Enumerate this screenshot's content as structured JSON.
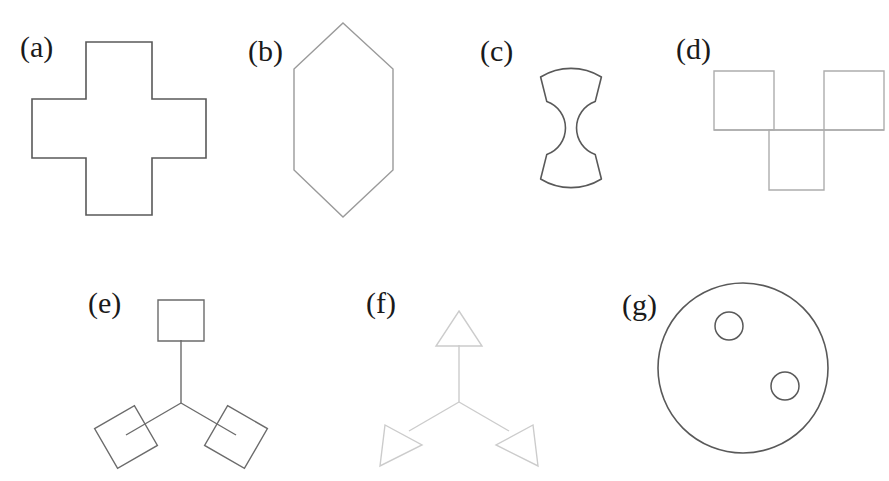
{
  "figure": {
    "background_color": "#ffffff",
    "width": 889,
    "height": 481,
    "panel_count": 7,
    "label_color": "#1a1a1a"
  },
  "panels": [
    {
      "key": "a",
      "label": "(a)",
      "shape_name": "greek-cross",
      "description": "Equal-armed plus sign / Greek cross outline",
      "stroke_color": "#595959",
      "stroke_width": 1.6,
      "label_x": 20,
      "label_y": 32,
      "bounds": {
        "x": 32,
        "y": 42,
        "width": 174,
        "height": 174
      }
    },
    {
      "key": "b",
      "label": "(b)",
      "shape_name": "elongated-hexagon",
      "description": "Vertically elongated hexagon outline",
      "stroke_color": "#9a9a9a",
      "stroke_width": 1.4,
      "label_x": 248,
      "label_y": 36,
      "bounds": {
        "x": 294,
        "y": 23,
        "width": 99,
        "height": 194
      }
    },
    {
      "key": "c",
      "label": "(c)",
      "shape_name": "circle-with-two-side-bites",
      "description": "Circle with semicircular notches cut from left and right sides",
      "stroke_color": "#595959",
      "stroke_width": 1.6,
      "label_x": 480,
      "label_y": 36,
      "bounds": {
        "x": 513,
        "y": 62,
        "width": 116,
        "height": 132
      }
    },
    {
      "key": "d",
      "label": "(d)",
      "shape_name": "three-square-tetromino",
      "description": "Three squares: two on top row separated by a gap, one below centered in the gap",
      "stroke_color": "#adadad",
      "stroke_width": 1.4,
      "label_x": 676,
      "label_y": 34,
      "bounds": {
        "x": 714,
        "y": 71,
        "width": 170,
        "height": 119
      }
    },
    {
      "key": "e",
      "label": "(e)",
      "shape_name": "triskelion-with-squares",
      "description": "Three-armed Y junction with a square terminal on each arm",
      "stroke_color": "#6b6b6b",
      "stroke_width": 1.4,
      "label_x": 88,
      "label_y": 288,
      "bounds": {
        "x": 78,
        "y": 300,
        "width": 208,
        "height": 170
      }
    },
    {
      "key": "f",
      "label": "(f)",
      "shape_name": "triskelion-with-triangles",
      "description": "Three-armed Y junction with a triangle terminal on each arm",
      "stroke_color": "#cccccc",
      "stroke_width": 1.4,
      "label_x": 366,
      "label_y": 288,
      "bounds": {
        "x": 372,
        "y": 308,
        "width": 178,
        "height": 160
      }
    },
    {
      "key": "g",
      "label": "(g)",
      "shape_name": "circle-with-two-holes",
      "description": "Large circle containing two small circles",
      "stroke_color": "#595959",
      "stroke_width": 1.6,
      "label_x": 622,
      "label_y": 290,
      "bounds": {
        "x": 658,
        "y": 283,
        "width": 170,
        "height": 170
      }
    }
  ],
  "geometry": {
    "cross": {
      "points": "86,42 152,42 152,99 206,99 206,158 152,158 152,215 86,215 86,158 32,158 32,99 86,99",
      "arm_width": 66
    },
    "hexagon": {
      "points": "343,23 393,69 393,170 343,217 294,170 294,69"
    },
    "bitten_circle": {
      "center_x": 571,
      "center_y": 128,
      "radius": 58,
      "bite_radius": 28,
      "path": "M 540.6 77.0 A 58 58 0 0 1 601.4 77.0 L 595.2 101.6 A 28 28 0 0 0 595.2 154.4 L 601.4 179.0 A 58 58 0 0 1 540.6 179.0 L 546.8 154.4 A 28 28 0 0 0 546.8 101.6 Z"
    },
    "three_squares": {
      "square_size": 60,
      "squares": [
        {
          "x": 714,
          "y": 71
        },
        {
          "x": 824,
          "y": 71
        },
        {
          "x": 769,
          "y": 130
        }
      ],
      "joining_line": {
        "x1": 714,
        "y1": 130,
        "x2": 884,
        "y2": 130
      }
    },
    "triskelion_squares": {
      "center_x": 181,
      "center_y": 403,
      "arm_length": 60,
      "terminal_size": 46,
      "arms": [
        {
          "angle_deg": -90,
          "terminal": "square"
        },
        {
          "angle_deg": 150,
          "terminal": "square"
        },
        {
          "angle_deg": 30,
          "terminal": "square"
        }
      ]
    },
    "triskelion_triangles": {
      "center_x": 459,
      "center_y": 402,
      "arm_length": 58,
      "terminal_size": 46,
      "arms": [
        {
          "angle_deg": -90,
          "terminal": "triangle"
        },
        {
          "angle_deg": 150,
          "terminal": "triangle"
        },
        {
          "angle_deg": 30,
          "terminal": "triangle"
        }
      ]
    },
    "holed_circle": {
      "outer": {
        "cx": 743,
        "cy": 368,
        "r": 85
      },
      "holes": [
        {
          "cx": 729,
          "cy": 326,
          "r": 14
        },
        {
          "cx": 785,
          "cy": 386,
          "r": 14
        }
      ]
    }
  }
}
